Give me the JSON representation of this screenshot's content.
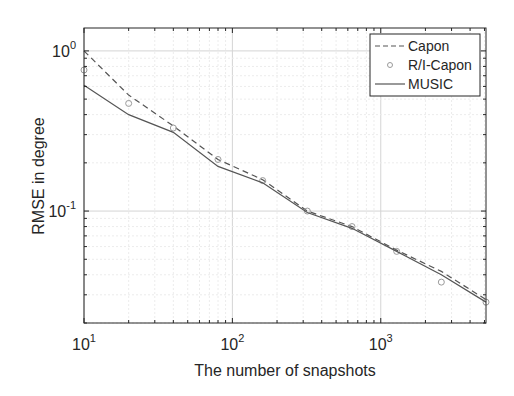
{
  "chart_data": {
    "type": "line",
    "title": "",
    "xlabel": "The number of snapshots",
    "ylabel": "RMSE in degree",
    "xscale": "log",
    "yscale": "log",
    "xlim": [
      10,
      5120
    ],
    "ylim": [
      0.02,
      1.39
    ],
    "grid": true,
    "legend_position": "upper right",
    "x_ticks": [
      10,
      100,
      1000
    ],
    "x_tick_labels": [
      {
        "base": "10",
        "exp": "1"
      },
      {
        "base": "10",
        "exp": "2"
      },
      {
        "base": "10",
        "exp": "3"
      }
    ],
    "y_ticks": [
      0.1,
      1
    ],
    "y_tick_labels": [
      {
        "base": "10",
        "exp": "-1"
      },
      {
        "base": "10",
        "exp": "0"
      }
    ],
    "x": [
      10,
      20,
      40,
      80,
      160,
      320,
      640,
      1280,
      2560,
      5120
    ],
    "series": [
      {
        "name": "Capon",
        "style": "dashed",
        "color": "#555555",
        "values": [
          1.0,
          0.53,
          0.34,
          0.21,
          0.157,
          0.1,
          0.08,
          0.057,
          0.042,
          0.028
        ]
      },
      {
        "name": "R/I-Capon",
        "style": "circle-marker",
        "color": "#9a9a9a",
        "values": [
          0.76,
          0.47,
          0.33,
          0.21,
          0.155,
          0.1,
          0.08,
          0.056,
          0.036,
          0.027
        ]
      },
      {
        "name": "MUSIC",
        "style": "solid",
        "color": "#555555",
        "values": [
          0.61,
          0.4,
          0.31,
          0.19,
          0.15,
          0.098,
          0.078,
          0.056,
          0.04,
          0.027
        ]
      }
    ]
  }
}
